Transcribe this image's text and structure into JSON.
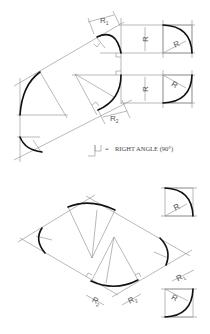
{
  "figure": {
    "legend": {
      "symbol": "right-angle-icon",
      "equals": "=",
      "text": "RIGHT ANGLE (90°)"
    },
    "labels": {
      "r1": "R",
      "r1_sub": "1",
      "r2": "R",
      "r2_sub": "2",
      "r": "R"
    },
    "colors": {
      "thick_line": "#111111",
      "thin_line": "#8a8a8a",
      "background": "#ffffff"
    }
  }
}
